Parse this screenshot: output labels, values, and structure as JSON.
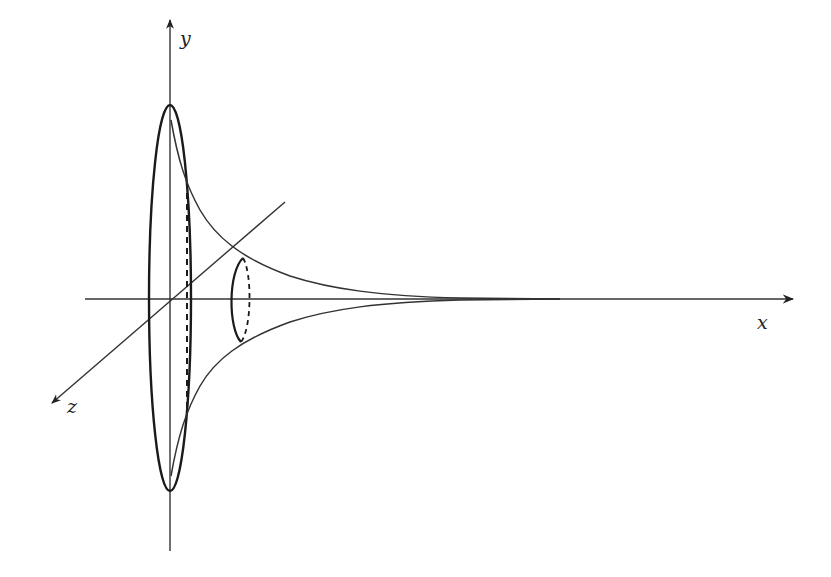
{
  "figure": {
    "stroke_color": "#222222",
    "background": "#ffffff",
    "axes": {
      "x": {
        "label": "x"
      },
      "y": {
        "label": "y"
      },
      "z": {
        "label": "z"
      }
    },
    "cross_sections": [
      {
        "name": "large-opening-ellipse",
        "style": "solid"
      },
      {
        "name": "large-inner-dashed-section",
        "style": "dashed"
      },
      {
        "name": "small-cross-section",
        "style": "solid-front dashed-back"
      }
    ]
  }
}
